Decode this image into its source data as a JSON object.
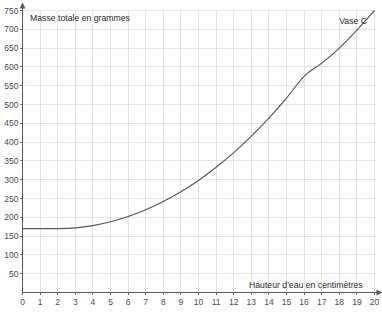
{
  "chart_data": {
    "type": "line",
    "title": "",
    "xlabel": "Hauteur d'eau en centimètres",
    "ylabel": "Masse totale en grammes",
    "series_label": "Vase C",
    "xlim": [
      0,
      20
    ],
    "ylim": [
      0,
      750
    ],
    "grid": true,
    "legend_position": "inline-top-right",
    "x_ticks": [
      0,
      1,
      2,
      3,
      4,
      5,
      6,
      7,
      8,
      9,
      10,
      11,
      12,
      13,
      14,
      15,
      16,
      17,
      18,
      19,
      20
    ],
    "y_ticks": [
      50,
      100,
      150,
      200,
      250,
      300,
      350,
      400,
      450,
      500,
      550,
      600,
      650,
      700,
      750
    ],
    "x_tick_labels": [
      "0",
      "1",
      "2",
      "3",
      "4",
      "5",
      "6",
      "7",
      "8",
      "9",
      "10",
      "11",
      "12",
      "13",
      "14",
      "15",
      "16",
      "17",
      "18",
      "19",
      "20"
    ],
    "y_tick_labels": [
      "50",
      "100",
      "150",
      "200",
      "250",
      "300",
      "350",
      "400",
      "450",
      "500",
      "550",
      "600",
      "650",
      "700",
      "750"
    ],
    "x": [
      0,
      1,
      2,
      3,
      4,
      5,
      6,
      7,
      8,
      9,
      10,
      11,
      12,
      13,
      14,
      15,
      16,
      17,
      18,
      19,
      20
    ],
    "values": [
      170,
      170,
      170,
      172,
      178,
      188,
      202,
      220,
      242,
      268,
      298,
      333,
      372,
      416,
      464,
      517,
      575,
      610,
      650,
      698,
      750
    ],
    "series": [
      {
        "name": "Vase C",
        "color": "#555555",
        "values": [
          170,
          170,
          170,
          172,
          178,
          188,
          202,
          220,
          242,
          268,
          298,
          333,
          372,
          416,
          464,
          517,
          575,
          610,
          650,
          698,
          750
        ]
      }
    ]
  },
  "axes": {
    "y_caption": "Masse totale en grammes",
    "x_caption": "Hauteur d'eau en centimètres"
  },
  "annotations": {
    "curve_label": "Vase C"
  },
  "colors": {
    "curve": "#555555",
    "grid": "#d8d8d8",
    "axis": "#5a5a5a",
    "tick_text": "#4a4a4a",
    "caption_text": "#1f1f1f",
    "background": "#ffffff"
  }
}
